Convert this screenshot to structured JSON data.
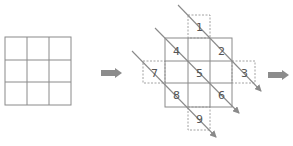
{
  "diagram": {
    "stroke_color": "#8a8a8a",
    "arrow_color": "#8a8a8a",
    "block_arrow_color": "#8c8c8c",
    "left_grid": {
      "rows": 3,
      "cols": 3
    },
    "center_grid": {
      "rows": 3,
      "cols": 3,
      "cells": [
        {
          "label": "4",
          "row": 0,
          "col": 0
        },
        {
          "label": "2",
          "row": 0,
          "col": 2
        },
        {
          "label": "5",
          "row": 1,
          "col": 1
        },
        {
          "label": "8",
          "row": 2,
          "col": 0
        },
        {
          "label": "6",
          "row": 2,
          "col": 2
        }
      ],
      "outside_cells": [
        {
          "label": "1",
          "position": "top"
        },
        {
          "label": "7",
          "position": "left"
        },
        {
          "label": "3",
          "position": "right"
        },
        {
          "label": "9",
          "position": "bottom"
        }
      ]
    },
    "diagonal_arrows": [
      {
        "passes": [
          "1",
          "2",
          "3"
        ]
      },
      {
        "passes": [
          "4",
          "5",
          "6"
        ]
      },
      {
        "passes": [
          "7",
          "8",
          "9"
        ]
      }
    ],
    "labels": {
      "n1": "1",
      "n2": "2",
      "n3": "3",
      "n4": "4",
      "n5": "5",
      "n6": "6",
      "n7": "7",
      "n8": "8",
      "n9": "9"
    }
  }
}
